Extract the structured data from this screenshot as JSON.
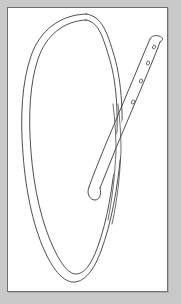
{
  "image": {
    "domain": "Natural-Image",
    "kind": "line-drawing",
    "subject": "belt-strap-forming-loop",
    "caption": "",
    "width": 181,
    "height": 304
  },
  "colors": {
    "background": "#c9c9c9",
    "card": "#ffffff",
    "frame": "#6e6e73",
    "ink": "#3a3a3a",
    "ink_soft": "#4a4a4a",
    "hole_fill": "#ffffff"
  },
  "card": {
    "x": 7,
    "y": 7,
    "width": 161,
    "height": 285,
    "border_width": 1
  },
  "figure": {
    "name": "belt-loop-drawing",
    "parts": [
      {
        "name": "loop-outer-contour",
        "label": "outer edge of the looped belt",
        "path": "M 118 44 C 112 26 96 14 76 13 C 50 12 26 33 22 72 C 17 112 20 160 31 208 C 39 244 52 270 66 272 C 80 274 93 256 100 226 C 110 183 116 126 118 82 Z"
      },
      {
        "name": "loop-inner-contour",
        "label": "inner edge of the looped belt",
        "path": "M 113 48 C 107 32 93 21 77 20 C 54 19 32 39 28 75 C 24 113 27 159 37 205 C 44 239 56 264 67 266 C 78 268 89 251 95 223 C 104 181 110 128 113 84 Z"
      },
      {
        "name": "free-end-strap",
        "label": "free end of the belt with punch holes, crossing over the loop",
        "tip_top": {
          "x": 147,
          "y": 39
        },
        "tip_bottom": {
          "x": 143,
          "y": 197
        }
      },
      {
        "name": "punch-holes",
        "label": "oval punch holes along the free end of the strap",
        "count": 4,
        "holes": [
          {
            "x": 145,
            "y": 46,
            "rx": 1.5,
            "ry": 2.0,
            "rot": 14
          },
          {
            "x": 140,
            "y": 61,
            "rx": 1.6,
            "ry": 2.1,
            "rot": 14
          },
          {
            "x": 134,
            "y": 80,
            "rx": 1.6,
            "ry": 2.1,
            "rot": 14
          },
          {
            "x": 127,
            "y": 100,
            "rx": 1.6,
            "ry": 2.1,
            "rot": 14
          }
        ]
      },
      {
        "name": "crossing-point",
        "label": "point where the free end crosses over the loop",
        "x": 119,
        "y": 90
      }
    ]
  }
}
